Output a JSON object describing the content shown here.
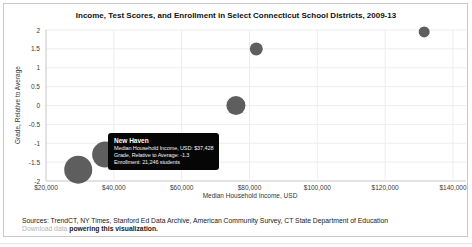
{
  "chart": {
    "title": "Income, Test Scores, and Enrollment in Select Connecticut School Districts, 2009-13",
    "x_axis": {
      "label": "Median Household Income, USD",
      "ticks": [
        "$20,000",
        "$40,000",
        "$60,000",
        "$80,000",
        "$100,000",
        "$120,000",
        "$140,000"
      ]
    },
    "y_axis": {
      "label": "Grade, Relative to Average",
      "ticks": [
        "2",
        "1.5",
        "1",
        "0.5",
        "0",
        "-0.5",
        "-1",
        "-1.5",
        "-2"
      ]
    }
  },
  "chart_data": {
    "type": "scatter",
    "title": "Income, Test Scores, and Enrollment in Select Connecticut School Districts, 2009-13",
    "xlabel": "Median Household Income, USD",
    "ylabel": "Grade, Relative to Average",
    "xlim": [
      20000,
      140000
    ],
    "ylim": [
      -2,
      2
    ],
    "grid": true,
    "legend": false,
    "points": [
      {
        "name": "",
        "income_usd": 29500,
        "grade": -1.7,
        "r_px": 14
      },
      {
        "name": "New Haven",
        "income_usd": 37428,
        "grade": -1.3,
        "enrollment": 21246,
        "r_px": 13
      },
      {
        "name": "",
        "income_usd": 76000,
        "grade": 0.0,
        "r_px": 9.5
      },
      {
        "name": "",
        "income_usd": 82000,
        "grade": 1.5,
        "r_px": 6.5
      },
      {
        "name": "",
        "income_usd": 131500,
        "grade": 1.95,
        "r_px": 5.5
      }
    ]
  },
  "tooltip": {
    "title": "New Haven",
    "lines": [
      "Median Household Income, USD: $37,428",
      "Grade, Relative to Average: -1.3",
      "Enrollment: 21,246 students"
    ]
  },
  "footer": {
    "sources": "Sources: TrendCT, NY Times, Stanford Ed Data Archive, American Community Survey, CT State Department of Education",
    "download_link": "Download data",
    "download_rest": " powering this visualization."
  },
  "colors": {
    "bubble": "#4d4d4d",
    "grid": "#ededed",
    "axis": "#c6c6c6",
    "tooltip_bg": "#060606",
    "tooltip_text": "#ffffff",
    "link": "#b3b3b3"
  }
}
